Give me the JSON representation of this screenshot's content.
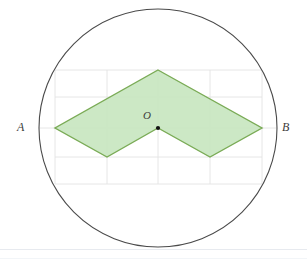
{
  "figure": {
    "background_color": "#ffffff",
    "labels": {
      "left_point": "A",
      "right_point": "B",
      "center_point": "O"
    },
    "circle": {
      "center_x": 158,
      "center_y": 128,
      "radius": 119,
      "stroke_color": "#4a4a4a",
      "stroke_width": 1.1,
      "fill": "none"
    },
    "center_dot": {
      "x": 158,
      "y": 128,
      "radius": 2.1,
      "color": "#111111"
    },
    "grid": {
      "stroke_color": "#e3e3e3",
      "stroke_width": 0.9,
      "x_lines": [
        55,
        107,
        158,
        210,
        262
      ],
      "y_lines": [
        70,
        97,
        128,
        157,
        184
      ],
      "left": 55,
      "right": 262,
      "top": 70,
      "bottom": 184
    },
    "polygon": {
      "name": "chevron",
      "points": "158,70 262,128 210,157 158,128 107,157 55,128",
      "fill_color": "#c8e6c0",
      "fill_opacity": 0.92,
      "stroke_color": "#7aab56",
      "stroke_width": 1.4,
      "vertices": [
        {
          "name": "top-apex",
          "x": 158,
          "y": 70
        },
        {
          "name": "right-point",
          "x": 262,
          "y": 128
        },
        {
          "name": "bottom-right",
          "x": 210,
          "y": 157
        },
        {
          "name": "center-notch",
          "x": 158,
          "y": 128
        },
        {
          "name": "bottom-left",
          "x": 107,
          "y": 157
        },
        {
          "name": "left-point",
          "x": 55,
          "y": 128
        }
      ]
    },
    "diameter_line": {
      "x1": 39,
      "y1": 128,
      "x2": 277,
      "y2": 128,
      "stroke_color": "#e3e3e3",
      "stroke_width": 0.9
    }
  }
}
